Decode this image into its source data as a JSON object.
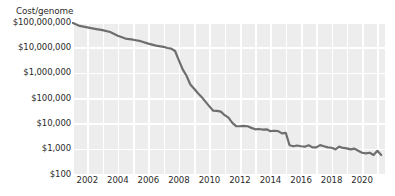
{
  "chart_data": {
    "type": "line",
    "title": "Cost/genome",
    "xlabel": "",
    "ylabel": "Cost/genome",
    "yscale": "log",
    "ylim": [
      100,
      100000000
    ],
    "xlim": [
      2001,
      2021.5
    ],
    "grid": true,
    "legend": "none",
    "line_color": "#6e6e6e",
    "plot_bg_color": "#ededed",
    "grid_color": "#ffffff",
    "text_color": "#2b2b2b",
    "ytick_labels": [
      "$100,000,000",
      "$10,000,000",
      "$1,000,000",
      "$100,000",
      "$10,000",
      "$1,000",
      "$100"
    ],
    "ytick_values": [
      100000000,
      10000000,
      1000000,
      100000,
      10000,
      1000,
      100
    ],
    "xtick_labels": [
      "2002",
      "2004",
      "2006",
      "2008",
      "2010",
      "2012",
      "2014",
      "2016",
      "2018",
      "2020"
    ],
    "xtick_values": [
      2002,
      2004,
      2006,
      2008,
      2010,
      2012,
      2014,
      2016,
      2018,
      2020
    ],
    "series": [
      {
        "name": "Cost per genome",
        "x": [
          2001.0,
          2001.5,
          2002.0,
          2002.5,
          2003.0,
          2003.5,
          2004.0,
          2004.5,
          2005.0,
          2005.5,
          2006.0,
          2006.5,
          2007.0,
          2007.25,
          2007.5,
          2007.75,
          2008.0,
          2008.25,
          2008.5,
          2008.75,
          2009.0,
          2009.25,
          2009.5,
          2009.75,
          2010.0,
          2010.25,
          2010.5,
          2010.75,
          2011.0,
          2011.25,
          2011.5,
          2011.75,
          2012.0,
          2012.25,
          2012.5,
          2012.75,
          2013.0,
          2013.25,
          2013.5,
          2013.75,
          2014.0,
          2014.25,
          2014.5,
          2014.75,
          2015.0,
          2015.25,
          2015.5,
          2015.75,
          2016.0,
          2016.25,
          2016.5,
          2016.75,
          2017.0,
          2017.25,
          2017.5,
          2017.75,
          2018.0,
          2018.25,
          2018.5,
          2018.75,
          2019.0,
          2019.25,
          2019.5,
          2019.75,
          2020.0,
          2020.25,
          2020.5,
          2020.75,
          2021.0,
          2021.25
        ],
        "y": [
          95263072,
          70175437,
          61448422,
          53751684,
          47715000,
          40157554,
          28780376,
          22205400,
          20000000,
          17500000,
          14000000,
          11732535,
          10474556,
          9408739,
          8927342,
          7147571,
          3063820,
          1352982,
          752080,
          342502,
          232735,
          154714,
          108065,
          70333,
          46774,
          31512,
          31125,
          29092,
          20963,
          16712,
          10497,
          7743,
          7666,
          7950,
          7663,
          6618,
          5826,
          5985,
          5671,
          5826,
          4920,
          5096,
          4905,
          4008,
          4211,
          1363,
          1245,
          1332,
          1245,
          1195,
          1363,
          1121,
          1121,
          1385,
          1245,
          1121,
          1089,
          942,
          1200,
          1070,
          1023,
          942,
          1006,
          823,
          689,
          653,
          689,
          562,
          823,
          562
        ]
      }
    ]
  }
}
